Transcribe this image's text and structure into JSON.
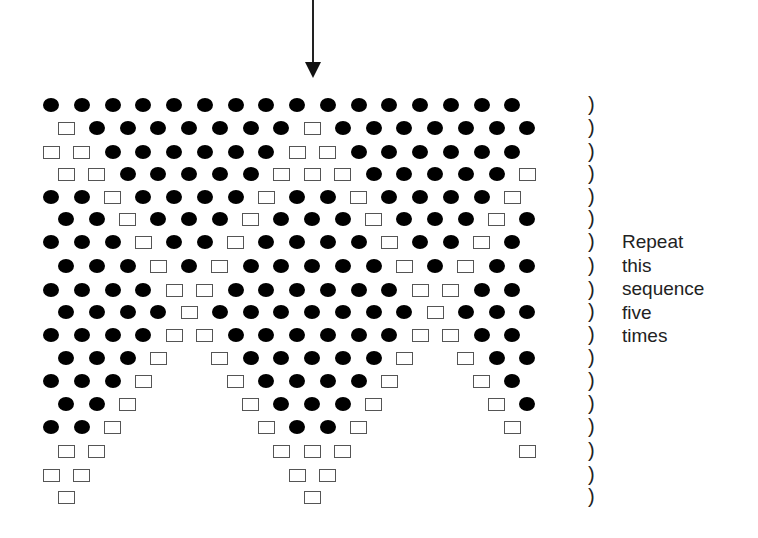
{
  "diagram": {
    "arrow": {
      "direction": "down",
      "x": 313
    },
    "legend": {
      "D": "filled-dot",
      "S": "open-square",
      "_": "empty"
    },
    "rows": [
      "DDDDDDDDDDDDDDDD",
      "SDDDDDDDSDDDDDDD",
      "SSDDDDDDSSDDDDDD",
      "SSDDDDDSSSDDDDDS",
      "DDSDDDDSDDSDDDDS",
      "DDSDDDSDDDSDDDSD",
      "DDDSDDSDDDDSDDSD",
      "DDDSDSDDDDDSDSDD",
      "DDDDSSDDDDDDSSDD",
      "DDDDSDDDDDDDSDDD",
      "DDDDSSDDDDDDSSDD",
      "DDDS_SDDDDDS_SDD",
      "DDDS__SDDDDS__SD",
      "DDS___SDDDS___SD",
      "DDS____SDDS____S",
      "SS_____SSS_____S",
      "SS______SS______",
      "S_______S_______"
    ],
    "paren_glyph": ")",
    "note_lines": [
      "Repeat",
      "this",
      "sequence",
      "five",
      "times"
    ]
  }
}
